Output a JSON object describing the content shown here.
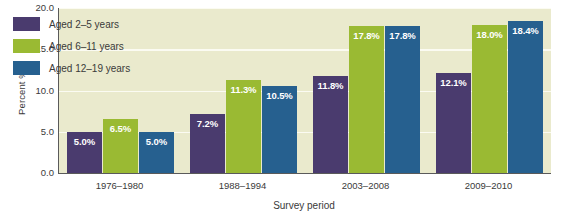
{
  "chart_data": {
    "type": "bar",
    "title": "",
    "xlabel": "Survey period",
    "ylabel": "Percent %",
    "categories": [
      "1976–1980",
      "1988–1994",
      "2003–2008",
      "2009–2010"
    ],
    "series": [
      {
        "name": "Aged 2–5 years",
        "color": "#4a3b6e",
        "values": [
          5.0,
          7.2,
          11.8,
          12.1
        ],
        "labels": [
          "5.0%",
          "7.2%",
          "11.8%",
          "12.1%"
        ]
      },
      {
        "name": "Aged 6–11 years",
        "color": "#9aba33",
        "values": [
          6.5,
          11.3,
          17.8,
          18.0
        ],
        "labels": [
          "6.5%",
          "11.3%",
          "17.8%",
          "18.0%"
        ]
      },
      {
        "name": "Aged 12–19 years",
        "color": "#26608f",
        "values": [
          5.0,
          10.5,
          17.8,
          18.4
        ],
        "labels": [
          "5.0%",
          "10.5%",
          "17.8%",
          "18.4%"
        ]
      }
    ],
    "ylim": [
      0.0,
      20.0
    ],
    "yticks": [
      "0.0",
      "5.0",
      "10.0",
      "15.0",
      "20.0"
    ],
    "ytick_values": [
      0.0,
      5.0,
      10.0,
      15.0,
      20.0
    ],
    "grid": true,
    "legend_position": "top-left",
    "plot_background": "#eaeacd",
    "gridline_color": "#fbfbf2",
    "axis_color": "#5a5a5a",
    "bar_label_color": "#ffffff"
  },
  "axes": {
    "y_title": "Percent %",
    "x_title": "Survey period"
  }
}
